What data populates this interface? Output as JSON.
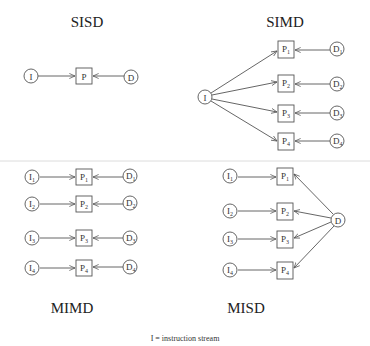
{
  "panels": {
    "sisd": {
      "title": "SISD",
      "instruction": "I",
      "processor": "P",
      "data": "D"
    },
    "simd": {
      "title": "SIMD",
      "instruction": "I",
      "processors": [
        {
          "base": "P",
          "sub": "1"
        },
        {
          "base": "P",
          "sub": "2"
        },
        {
          "base": "P",
          "sub": "3"
        },
        {
          "base": "P",
          "sub": "4"
        }
      ],
      "data": [
        {
          "base": "D",
          "sub": "1"
        },
        {
          "base": "D",
          "sub": "2"
        },
        {
          "base": "D",
          "sub": "3"
        },
        {
          "base": "D",
          "sub": "4"
        }
      ]
    },
    "mimd": {
      "title": "MIMD",
      "instructions": [
        {
          "base": "I",
          "sub": "1"
        },
        {
          "base": "I",
          "sub": "2"
        },
        {
          "base": "I",
          "sub": "3"
        },
        {
          "base": "I",
          "sub": "4"
        }
      ],
      "processors": [
        {
          "base": "P",
          "sub": "1"
        },
        {
          "base": "P",
          "sub": "2"
        },
        {
          "base": "P",
          "sub": "3"
        },
        {
          "base": "P",
          "sub": "4"
        }
      ],
      "data": [
        {
          "base": "D",
          "sub": "1"
        },
        {
          "base": "D",
          "sub": "2"
        },
        {
          "base": "D",
          "sub": "3"
        },
        {
          "base": "D",
          "sub": "4"
        }
      ]
    },
    "misd": {
      "title": "MISD",
      "instructions": [
        {
          "base": "I",
          "sub": "1"
        },
        {
          "base": "I",
          "sub": "2"
        },
        {
          "base": "I",
          "sub": "3"
        },
        {
          "base": "I",
          "sub": "4"
        }
      ],
      "processors": [
        {
          "base": "P",
          "sub": "1"
        },
        {
          "base": "P",
          "sub": "2"
        },
        {
          "base": "P",
          "sub": "3"
        },
        {
          "base": "P",
          "sub": "4"
        }
      ],
      "data": "D"
    }
  },
  "legend": "I = instruction stream"
}
